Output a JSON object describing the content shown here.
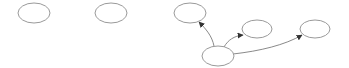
{
  "diagram": {
    "type": "directed-graph",
    "colors": {
      "node_stroke": "#9a9a9a",
      "edge_stroke": "#8a8a8a",
      "arrowhead": "#333333",
      "background": "#ffffff"
    },
    "nodes": [
      {
        "id": "n1",
        "label": "",
        "cx": 34,
        "cy": 13,
        "rx": 16,
        "ry": 10
      },
      {
        "id": "n2",
        "label": "",
        "cx": 111,
        "cy": 13,
        "rx": 16,
        "ry": 10
      },
      {
        "id": "n3",
        "label": "",
        "cx": 190,
        "cy": 13,
        "rx": 16,
        "ry": 10
      },
      {
        "id": "n4",
        "label": "",
        "cx": 257,
        "cy": 29,
        "rx": 15,
        "ry": 9
      },
      {
        "id": "n5",
        "label": "",
        "cx": 315,
        "cy": 29,
        "rx": 15,
        "ry": 9
      },
      {
        "id": "n6",
        "label": "",
        "cx": 218,
        "cy": 56,
        "rx": 16,
        "ry": 10
      }
    ],
    "edges": [
      {
        "from": "n6",
        "to": "n3"
      },
      {
        "from": "n6",
        "to": "n4"
      },
      {
        "from": "n6",
        "to": "n5"
      }
    ]
  }
}
